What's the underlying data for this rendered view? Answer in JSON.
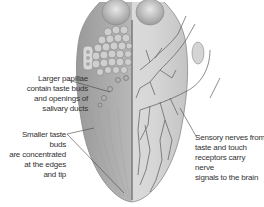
{
  "diagram": {
    "labels": {
      "larger_papillae": "Larger papillae contain taste buds and openings of salivary ducts",
      "larger_papillae_lines": [
        "Larger papillae",
        "contain taste buds",
        "and openings of",
        "salivary ducts"
      ],
      "smaller_taste_buds": "Smaller taste buds are concentrated at the edges and tip",
      "smaller_taste_buds_lines": [
        "Smaller taste buds",
        "are concentrated",
        "at the edges",
        "and tip"
      ],
      "sensory_nerves": "Sensory nerves from taste and touch receptors carry nerve signals to the brain",
      "sensory_nerves_lines": [
        "Sensory nerves from",
        "taste and touch",
        "receptors carry nerve",
        "signals to the brain"
      ]
    },
    "colors": {
      "background": "#ffffff",
      "tongue_surface": "#bdbdbd",
      "tongue_right_half": "#d9d9d9",
      "nerve": "#555555",
      "leader_line": "#444444",
      "text": "#333333"
    }
  }
}
